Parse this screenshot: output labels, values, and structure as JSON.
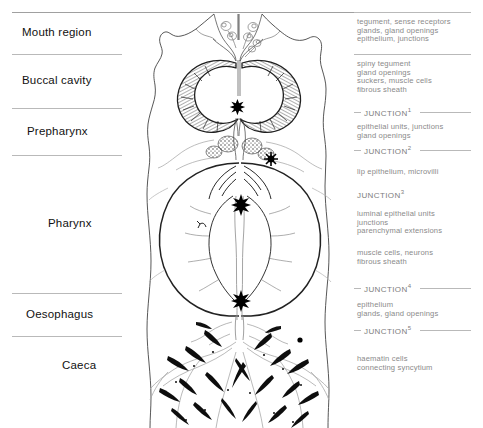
{
  "regions": [
    {
      "id": "mouth-region",
      "label": "Mouth region"
    },
    {
      "id": "buccal-cavity",
      "label": "Buccal cavity"
    },
    {
      "id": "prepharynx",
      "label": "Prepharynx"
    },
    {
      "id": "pharynx",
      "label": "Pharynx"
    },
    {
      "id": "oesophagus",
      "label": "Oesophagus"
    },
    {
      "id": "caeca",
      "label": "Caeca"
    }
  ],
  "annotations": [
    {
      "id": "anno-mouth",
      "text": "tegument, sense receptors\nglands, gland openings\nepithelium, junctions"
    },
    {
      "id": "anno-buccal",
      "text": "spiny tegument\ngland openings\nsuckers, muscle cells\nfibrous sheath"
    },
    {
      "id": "anno-prepharynx",
      "text": "epithelial units, junctions\ngland openings"
    },
    {
      "id": "anno-lip",
      "text": "lip epithelium, microvilli"
    },
    {
      "id": "anno-luminal",
      "text": "luminal epithelial units\njunctions\nparenchymal extensions"
    },
    {
      "id": "anno-muscle",
      "text": "muscle cells, neurons\nfibrous sheath"
    },
    {
      "id": "anno-oesophagus",
      "text": "epithelium\nglands, gland openings"
    },
    {
      "id": "anno-caeca",
      "text": "haematin cells\nconnecting syncytium"
    }
  ],
  "junctions": [
    {
      "id": "junction-1",
      "label": "JUNCTION",
      "superscript": "1"
    },
    {
      "id": "junction-2",
      "label": "JUNCTION",
      "superscript": "2"
    },
    {
      "id": "junction-3",
      "label": "JUNCTION",
      "superscript": "3"
    },
    {
      "id": "junction-4",
      "label": "JUNCTION",
      "superscript": "4"
    },
    {
      "id": "junction-5",
      "label": "JUNCTION",
      "superscript": "5"
    }
  ],
  "colors": {
    "ink": "#1a1a1a",
    "rule": "#b9b9b9",
    "annotation_text": "#8a8a8a",
    "outline": "#3a3a3a",
    "faint_outline": "#9a9a9a",
    "haematin": "#0d0d0d"
  }
}
